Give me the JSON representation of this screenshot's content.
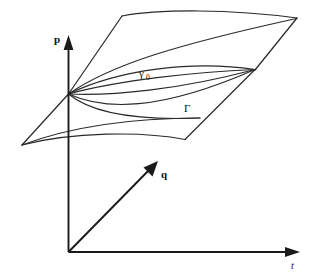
{
  "figure": {
    "kind": "mathematical-diagram",
    "background_color": "#ffffff",
    "line_color": "#2a2a2a",
    "axis_color": "#1a1a1a"
  },
  "axes": {
    "vertical": {
      "name": "p-axis",
      "label": "p",
      "label_x": 57,
      "label_y": 40,
      "direction": "up",
      "from": [
        68,
        252
      ],
      "to": [
        68,
        40
      ],
      "arrow": "up-arrow-icon"
    },
    "depth": {
      "name": "q-axis",
      "label": "q",
      "label_x": 159,
      "label_y": 177,
      "direction": "up-right-diagonal",
      "from": [
        68,
        252
      ],
      "to": [
        155,
        163
      ],
      "arrow": "diagonal-arrow-icon"
    },
    "horizontal": {
      "name": "t-axis",
      "label": "t",
      "label_x": 292,
      "label_y": 268,
      "direction": "right",
      "from": [
        68,
        252
      ],
      "to": [
        298,
        252
      ],
      "arrow": "right-arrow-icon"
    }
  },
  "labels": {
    "gamma_zero": {
      "name": "gamma-zero-label",
      "base": "γ",
      "subscript": "0",
      "x": 141,
      "y": 75
    },
    "gamma_capital": {
      "name": "gamma-capital-label",
      "text": "Γ",
      "x": 186,
      "y": 111
    }
  },
  "geometry": {
    "left_vertex": [
      68,
      95
    ],
    "right_fan_point": [
      255,
      70
    ],
    "top_left_corner": [
      122,
      16
    ],
    "top_right_corner": [
      297,
      18
    ],
    "lower_left_vertex": [
      22,
      145
    ],
    "lower_right_corner": [
      185,
      140
    ]
  },
  "curves": {
    "top_surface_upper_edge": "M122,16 C165,10 230,10 297,18",
    "top_surface_left_edge": "M122,16 L68,95",
    "top_surface_right_edge": "M297,18 L255,70",
    "sheet_right_edge_long": "M297,18 C280,35 268,55 255,70",
    "ridge_curve_1": "M68,95 C110,66 175,48 297,18",
    "ridge_curve_2": "M68,95 C120,70 190,62 255,70",
    "fan_curve_a": "M68,95 C118,76 190,70 255,70",
    "fan_curve_b": "M68,95 C120,86 192,78 255,70",
    "fan_curve_c": "M68,95 C112,100 180,94 255,70",
    "fan_curve_d": "M68,95 C105,113 160,115 255,70",
    "lower_sheet_left_edge": "M68,95 L22,145",
    "lower_sheet_bottom_curve": "M22,145 C70,134 140,133 185,140",
    "lower_sheet_right_edge": "M185,140 L255,70",
    "lower_sheet_inner_curve": "M22,145 C75,127 140,123 196,120",
    "lower_sheet_inner_curve_2": "M68,95 C100,106 150,110 196,120",
    "upper_band_curve": "M68,95 C120,78 196,66 258,62"
  }
}
